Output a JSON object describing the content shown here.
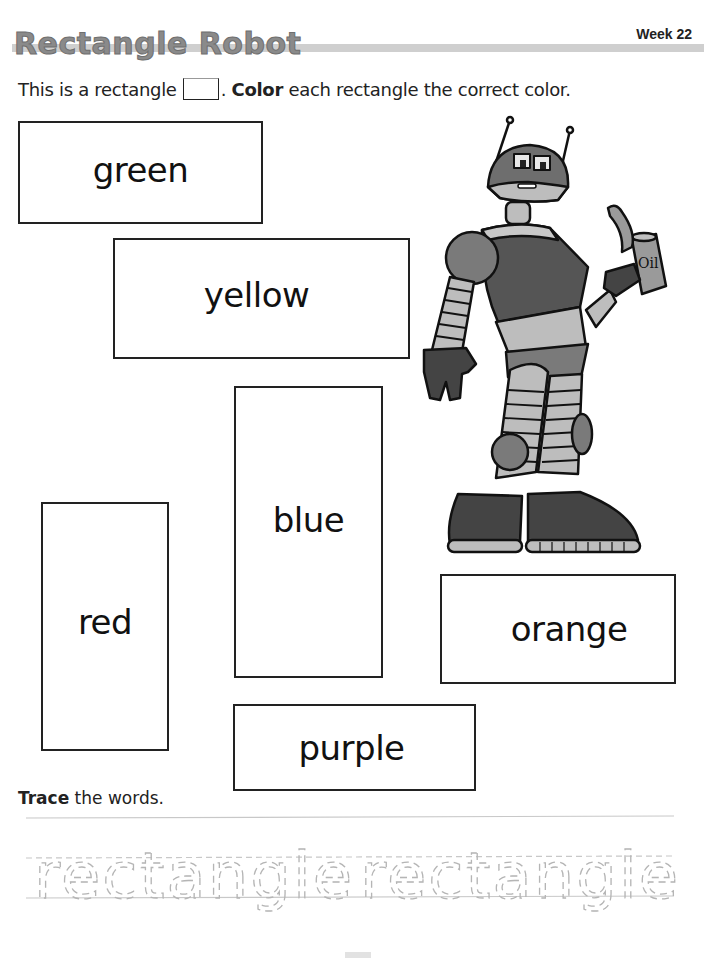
{
  "header": {
    "title": "Rectangle Robot",
    "week_label": "Week 22"
  },
  "instructions": {
    "part1": "This is a rectangle",
    "part2": ".",
    "bold_word": "Color",
    "part3": " each rectangle the correct color."
  },
  "rectangles": [
    {
      "label": "green"
    },
    {
      "label": "yellow"
    },
    {
      "label": "blue"
    },
    {
      "label": "red"
    },
    {
      "label": "orange"
    },
    {
      "label": "purple"
    }
  ],
  "illustration": {
    "subject": "robot holding oil can",
    "can_label": "Oil"
  },
  "trace": {
    "bold_word": "Trace",
    "rest": " the words.",
    "words": [
      "rectangle",
      "rectangle"
    ]
  },
  "colors": {
    "title_gray": "#8a8a8a",
    "rule_gray": "#cfcfcf",
    "trace_gray": "#b5b5b5"
  }
}
